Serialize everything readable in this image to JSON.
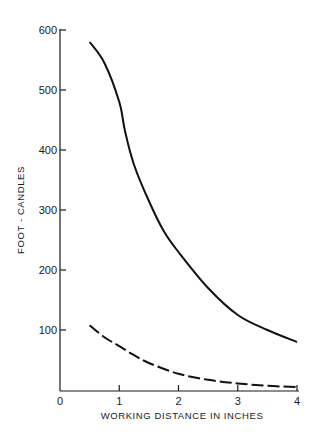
{
  "chart_data": {
    "type": "line",
    "title": "",
    "xlabel": "WORKING DISTANCE IN INCHES",
    "ylabel": "FOOT - CANDLES",
    "xlim": [
      0,
      4
    ],
    "ylim": [
      0,
      600
    ],
    "grid": false,
    "legend": null,
    "x_ticks": [
      "0",
      "1",
      "2",
      "3",
      "4"
    ],
    "y_ticks": [
      "100",
      "200",
      "300",
      "400",
      "500",
      "600"
    ],
    "series": [
      {
        "name": "solid curve",
        "style": "solid",
        "x": [
          0.5,
          0.75,
          1.0,
          1.1,
          1.25,
          1.5,
          1.75,
          2.0,
          2.5,
          3.0,
          3.5,
          4.0
        ],
        "values": [
          580,
          545,
          480,
          430,
          375,
          315,
          265,
          230,
          170,
          125,
          100,
          80
        ]
      },
      {
        "name": "dashed curve",
        "style": "dashed",
        "x": [
          0.5,
          0.75,
          1.0,
          1.25,
          1.5,
          2.0,
          2.5,
          3.0,
          3.5,
          4.0
        ],
        "values": [
          108,
          88,
          73,
          58,
          45,
          27,
          17,
          11,
          7,
          5
        ]
      }
    ]
  }
}
